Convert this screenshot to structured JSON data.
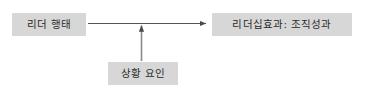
{
  "diagram": {
    "type": "flow-diagram",
    "background_color": "#ffffff",
    "node_fill_color": "#d7d7d7",
    "node_text_color": "#2b2b2b",
    "connector_color": "#555555",
    "nodes": [
      {
        "id": "leader-behavior",
        "label": "리더 행태",
        "role": "independent-variable"
      },
      {
        "id": "leadership-effect",
        "label": "리더십효과: 조직성과",
        "role": "dependent-variable"
      },
      {
        "id": "situational-factors",
        "label": "상황 요인",
        "role": "moderator-variable"
      }
    ],
    "connectors": [
      {
        "id": "leader-behavior-to-leadership-effect",
        "from": "leader-behavior",
        "to": "leadership-effect",
        "direction": "horizontal-right",
        "arrowhead": "end"
      },
      {
        "id": "situational-factors-to-main-path",
        "from": "situational-factors",
        "to": "leader-behavior-to-leadership-effect",
        "direction": "vertical-up",
        "arrowhead": "end"
      }
    ]
  }
}
